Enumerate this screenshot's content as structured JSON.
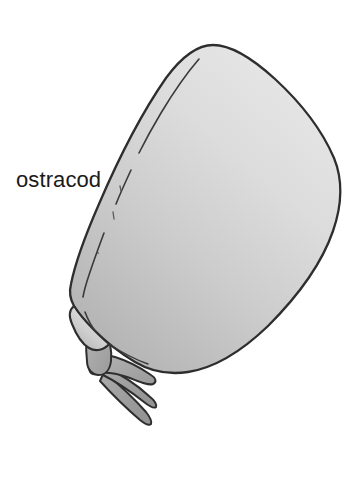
{
  "figure": {
    "kind": "scientific-illustration",
    "subject": "ostracod",
    "background_color": "#ffffff",
    "width": 358,
    "height": 484
  },
  "label": {
    "text": "ostracod",
    "color": "#1a1a1a",
    "x": 16,
    "y": 168,
    "font_size_px": 22
  },
  "organism": {
    "name": "ostracod",
    "parts": [
      {
        "id": "carapace",
        "name": "carapace",
        "description": "large teardrop-shaped bivalved shell, apex at upper-left, widest bulge at right",
        "fill_light": "#e4e4e4",
        "fill_mid": "#cdcdcd",
        "fill_dark": "#b2b2b2",
        "outline_color": "#2e2e2e",
        "outline_width": 2.2
      },
      {
        "id": "carapace-inner-ridge",
        "name": "inner valve margin line",
        "description": "broken contour line parallel to the anterior shell edge",
        "stroke_color": "#3a3a3a",
        "stroke_width": 1.5
      },
      {
        "id": "limb-proximal",
        "name": "proximal limb segment",
        "fill": "#a9a9a9",
        "outline_color": "#2e2e2e"
      },
      {
        "id": "limb-distal",
        "name": "distal limb segment",
        "fill": "#a2a2a2",
        "outline_color": "#2e2e2e"
      },
      {
        "id": "claw-upper",
        "name": "upper terminal claw",
        "fill": "#9e9e9e",
        "outline_color": "#2e2e2e"
      },
      {
        "id": "claw-lower",
        "name": "lower terminal claw",
        "fill": "#9e9e9e",
        "outline_color": "#2e2e2e"
      }
    ],
    "surface_marks": [
      {
        "id": "mark-1",
        "name": "shell-texture-dash"
      },
      {
        "id": "mark-2",
        "name": "shell-texture-dash"
      },
      {
        "id": "mark-3",
        "name": "shell-texture-dot"
      }
    ]
  }
}
